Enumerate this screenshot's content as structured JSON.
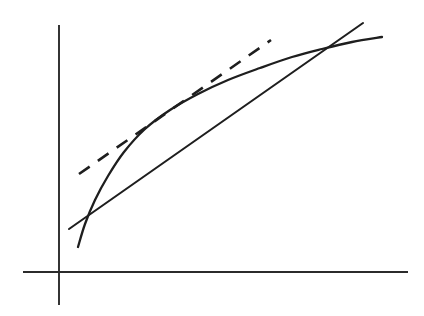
{
  "figure": {
    "title": "Concave curve with tangent line and secant chord",
    "background_color": "#ffffff",
    "ink_color": "#1e1e1e",
    "axis_color": "#2b2b2b",
    "width": 424,
    "height": 316
  },
  "chart_data": {
    "type": "line",
    "title": "Concave curve with tangent line and secant chord",
    "subtitle": "",
    "xlabel": "",
    "ylabel": "",
    "xlim": [
      23,
      408
    ],
    "ylim": [
      305,
      25
    ],
    "grid": false,
    "legend": "none",
    "annotations": [
      "Dashed line is tangent to the curve at the point of tangency",
      "Solid straight line is a secant chord crossing the curve twice"
    ],
    "axes": {
      "x_axis": {
        "name": "x-axis",
        "x_start": 23,
        "x_end": 408,
        "y": 272,
        "style": "solid"
      },
      "y_axis": {
        "name": "y-axis",
        "x": 59,
        "y_start": 25,
        "y_end": 305,
        "style": "solid"
      },
      "origin": {
        "x": 59,
        "y": 272
      }
    },
    "series": [
      {
        "name": "curve",
        "style": "solid",
        "shape": "concave-increasing",
        "points": [
          [
            78,
            247
          ],
          [
            85,
            224
          ],
          [
            95,
            200
          ],
          [
            108,
            176
          ],
          [
            124,
            152
          ],
          [
            145,
            129
          ],
          [
            170,
            110
          ],
          [
            198,
            94
          ],
          [
            228,
            80
          ],
          [
            260,
            68
          ],
          [
            292,
            57
          ],
          [
            322,
            49
          ],
          [
            352,
            42
          ],
          [
            382,
            37
          ]
        ]
      },
      {
        "name": "secant-chord",
        "style": "solid",
        "points": [
          [
            69,
            229
          ],
          [
            363,
            23
          ]
        ]
      },
      {
        "name": "tangent-line",
        "style": "dashed",
        "dash_length": 13,
        "gap_length": 10,
        "points": [
          [
            79,
            174
          ],
          [
            271,
            40
          ]
        ],
        "tangency_point": [
          145,
          129
        ]
      }
    ],
    "intersections": [
      {
        "name": "lower-crossing",
        "x": 81,
        "y": 222,
        "between": [
          "curve",
          "secant-chord"
        ]
      },
      {
        "name": "upper-crossing",
        "x": 322,
        "y": 49,
        "between": [
          "curve",
          "secant-chord"
        ]
      },
      {
        "name": "tangency",
        "x": 145,
        "y": 129,
        "between": [
          "curve",
          "tangent-line"
        ]
      }
    ]
  }
}
